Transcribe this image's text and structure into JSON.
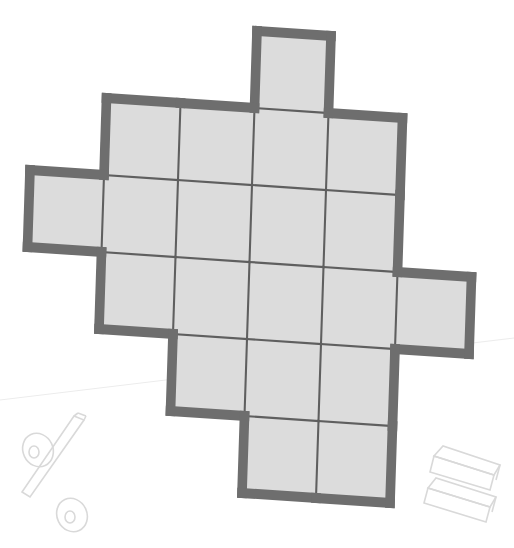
{
  "figure": {
    "cell_size_px": 74,
    "rotation_deg": 3.5,
    "fill_color": "#dcdcdc",
    "outline_color": "#6e6e6e",
    "grid_line_color": "#5f5f5f",
    "rows": [
      {
        "row": 0,
        "cols": [
          3
        ]
      },
      {
        "row": 1,
        "cols": [
          1,
          2,
          3,
          4
        ]
      },
      {
        "row": 2,
        "cols": [
          0,
          1,
          2,
          3,
          4
        ]
      },
      {
        "row": 3,
        "cols": [
          1,
          2,
          3,
          4,
          5
        ]
      },
      {
        "row": 4,
        "cols": [
          2,
          3,
          4
        ]
      },
      {
        "row": 5,
        "cols": [
          3,
          4
        ]
      }
    ],
    "total_squares": 19
  },
  "decorations": [
    {
      "name": "percent-sign-icon",
      "position": "bottom-left"
    },
    {
      "name": "stacked-blocks-icon",
      "position": "bottom-right"
    }
  ]
}
